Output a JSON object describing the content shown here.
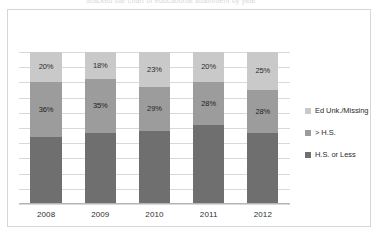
{
  "top_cut_text": "Stacked bar chart of educational attainment by year",
  "legend": {
    "position": "right",
    "items": [
      {
        "label": "Ed Unk./Missing",
        "color": "#c9c9c9",
        "swatch_icon": "square-swatch-icon"
      },
      {
        "label": "> H.S.",
        "color": "#9c9c9c",
        "swatch_icon": "square-swatch-icon"
      },
      {
        "label": "H.S. or Less",
        "color": "#6f6f6f",
        "swatch_icon": "square-swatch-icon"
      }
    ]
  },
  "chart_data": {
    "type": "bar",
    "stacked": true,
    "title": "",
    "subtitle": "",
    "xlabel": "",
    "ylabel": "",
    "ylim": [
      0,
      100
    ],
    "grid": true,
    "gridlines_count": 10,
    "legend_position": "right",
    "categories": [
      "2008",
      "2009",
      "2010",
      "2011",
      "2012"
    ],
    "series": [
      {
        "name": "H.S. or Less",
        "color": "#6f6f6f",
        "values": [
          44,
          47,
          48,
          52,
          47
        ],
        "labels": [
          "",
          "",
          "",
          "",
          ""
        ]
      },
      {
        "name": "> H.S.",
        "color": "#9c9c9c",
        "values": [
          36,
          35,
          29,
          28,
          28
        ],
        "labels": [
          "36%",
          "35%",
          "29%",
          "28%",
          "28%"
        ]
      },
      {
        "name": "Ed Unk./Missing",
        "color": "#c9c9c9",
        "values": [
          20,
          18,
          23,
          20,
          25
        ],
        "labels": [
          "20%",
          "18%",
          "23%",
          "20%",
          "25%"
        ]
      }
    ]
  }
}
